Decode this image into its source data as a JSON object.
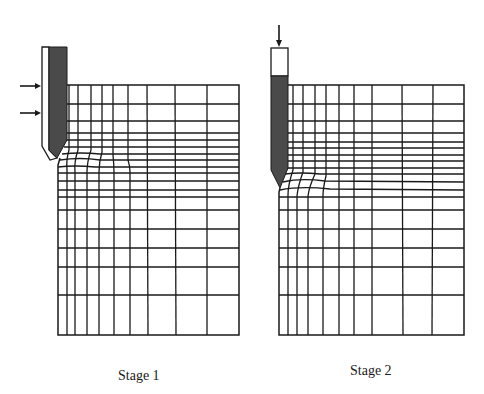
{
  "figure": {
    "panels": [
      {
        "id": "stage-1",
        "caption": "Stage 1",
        "load_direction": "lateral",
        "arrows": 2
      },
      {
        "id": "stage-2",
        "caption": "Stage 2",
        "load_direction": "vertical",
        "arrows": 1
      }
    ],
    "colors": {
      "line": "#1a1a1a",
      "pile_fill": "#4a4a4a",
      "background": "#ffffff"
    }
  }
}
